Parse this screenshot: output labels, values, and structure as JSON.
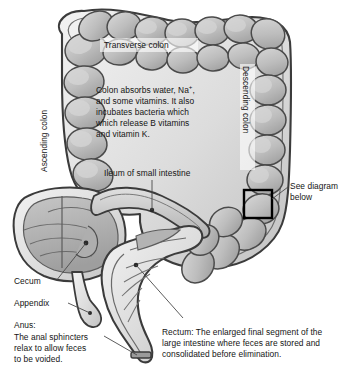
{
  "figure": {
    "background_color": "#ffffff",
    "outline_color": "#3a3a3a",
    "wall_fill": "#e8e8e8",
    "lumen_fill": "#b9b9b9",
    "haustra_fill": "#cfcfcf",
    "callout_box_color": "#000000",
    "leader_line_color": "#4a4a4a",
    "text_color": "#141414"
  },
  "labels": {
    "transverse_colon": "Transverse colon",
    "ascending_colon": "Ascending colon",
    "descending_colon": "Descending colon",
    "ileum": "Ileum of small intestine",
    "cecum": "Cecum",
    "appendix": "Appendix",
    "see_diagram_line1": "See diagram",
    "see_diagram_line2": "below"
  },
  "notes": {
    "colon_function": {
      "line1_a": "Colon absorbs water, Na",
      "line1_sup": "+",
      "line1_b": ",",
      "line2": "and some vitamins. It also",
      "line3": "incubates bacteria which",
      "line4": "which release B vitamins",
      "line5": "and vitamin K."
    },
    "anus": {
      "heading": "Anus:",
      "line1": "The anal sphincters",
      "line2": "relax to allow feces",
      "line3": "to be voided."
    },
    "rectum": {
      "line1": "Rectum: The enlarged final segment of the",
      "line2": "large intestine where feces are stored and",
      "line3": "consolidated before elimination."
    }
  }
}
